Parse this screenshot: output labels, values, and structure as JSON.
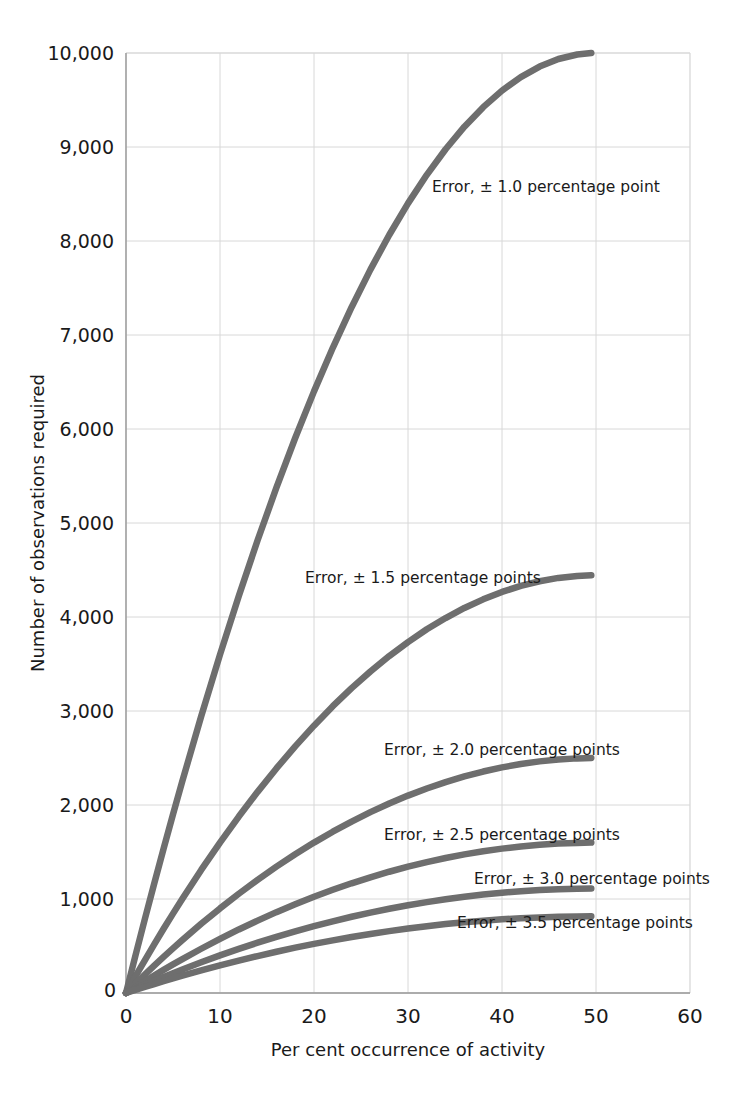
{
  "chart_data": {
    "type": "line",
    "title": "",
    "xlabel": "Per cent occurrence of activity",
    "ylabel": "Number of observations required",
    "xlim": [
      0,
      60
    ],
    "ylim": [
      0,
      10000
    ],
    "xticks": [
      "0",
      "10",
      "20",
      "30",
      "40",
      "50",
      "60"
    ],
    "xtick_values": [
      0,
      10,
      20,
      30,
      40,
      50,
      60
    ],
    "yticks": [
      "0",
      "1,000",
      "2,000",
      "3,000",
      "4,000",
      "5,000",
      "6,000",
      "7,000",
      "8,000",
      "9,000",
      "10,000"
    ],
    "ytick_values": [
      0,
      1000,
      2000,
      3000,
      4000,
      5000,
      6000,
      7000,
      8000,
      9000,
      10000
    ],
    "grid": true,
    "legend_position": "inline-annotations",
    "x": [
      0,
      1,
      2,
      3,
      4,
      5,
      6,
      8,
      10,
      12,
      14,
      16,
      18,
      20,
      22,
      24,
      26,
      28,
      30,
      32,
      34,
      36,
      38,
      40,
      42,
      44,
      46,
      48,
      49.5
    ],
    "series": [
      {
        "name": "Error, ± 1.0 percentage point",
        "error": 1.0,
        "annotation": "Error,  ± 1.0 percentage point",
        "color": "#6e6e6e",
        "values": [
          0,
          396,
          784,
          1164,
          1536,
          1900,
          2256,
          2944,
          3600,
          4224,
          4816,
          5376,
          5904,
          6400,
          6864,
          7296,
          7696,
          8064,
          8400,
          8704,
          8976,
          9216,
          9424,
          9600,
          9744,
          9856,
          9936,
          9984,
          9999
        ]
      },
      {
        "name": "Error, ± 1.5 percentage points",
        "error": 1.5,
        "annotation": "Error,  ± 1.5 percentage points",
        "color": "#6e6e6e",
        "values": [
          0,
          176,
          348,
          517,
          683,
          844,
          1003,
          1309,
          1600,
          1877,
          2140,
          2389,
          2624,
          2844,
          3051,
          3243,
          3420,
          3584,
          3733,
          3869,
          3989,
          4096,
          4188,
          4267,
          4331,
          4380,
          4416,
          4437,
          4444
        ]
      },
      {
        "name": "Error, ± 2.0 percentage points",
        "error": 2.0,
        "annotation": "Error,  ± 2.0 percentage points",
        "color": "#6e6e6e",
        "values": [
          0,
          99,
          196,
          291,
          384,
          475,
          564,
          736,
          900,
          1056,
          1204,
          1344,
          1476,
          1600,
          1716,
          1824,
          1924,
          2016,
          2100,
          2176,
          2244,
          2304,
          2356,
          2400,
          2436,
          2464,
          2484,
          2496,
          2500
        ]
      },
      {
        "name": "Error, ± 2.5 percentage points",
        "error": 2.5,
        "annotation": "Error,  ± 2.5 percentage points",
        "color": "#6e6e6e",
        "values": [
          0,
          63,
          125,
          186,
          246,
          304,
          361,
          471,
          576,
          676,
          770,
          860,
          944,
          1024,
          1098,
          1167,
          1231,
          1290,
          1344,
          1393,
          1436,
          1475,
          1508,
          1536,
          1559,
          1577,
          1590,
          1597,
          1600
        ]
      },
      {
        "name": "Error, ± 3.0 percentage points",
        "error": 3.0,
        "annotation": "Error,  ± 3.0 percentage points",
        "color": "#6e6e6e",
        "values": [
          0,
          44,
          87,
          129,
          171,
          211,
          251,
          327,
          400,
          469,
          535,
          597,
          656,
          711,
          763,
          811,
          855,
          896,
          933,
          967,
          997,
          1024,
          1047,
          1067,
          1083,
          1095,
          1104,
          1109,
          1111
        ]
      },
      {
        "name": "Error, ± 3.5 percentage points",
        "error": 3.5,
        "annotation": "Error,  ± 3.5 percentage points",
        "color": "#6e6e6e",
        "values": [
          0,
          32,
          64,
          95,
          125,
          155,
          184,
          240,
          294,
          345,
          393,
          439,
          482,
          522,
          560,
          596,
          628,
          658,
          686,
          710,
          733,
          753,
          769,
          784,
          796,
          804,
          811,
          815,
          816
        ]
      }
    ],
    "annotations": [
      {
        "text": "Error,  ± 1.0 percentage point",
        "x": 432,
        "y": 192
      },
      {
        "text": "Error,  ± 1.5 percentage points",
        "x": 305,
        "y": 583
      },
      {
        "text": "Error,  ± 2.0 percentage points",
        "x": 384,
        "y": 755
      },
      {
        "text": "Error,  ± 2.5 percentage points",
        "x": 384,
        "y": 840
      },
      {
        "text": "Error,  ± 3.0 percentage points",
        "x": 474,
        "y": 884
      },
      {
        "text": "Error,  ± 3.5 percentage points",
        "x": 457,
        "y": 928
      }
    ],
    "colors": {
      "curve": "#6e6e6e",
      "grid": "#d8d8d8",
      "axis": "#9a9a9a",
      "text": "#1a1a1a",
      "background": "#ffffff"
    }
  },
  "axes": {
    "x_label": "Per cent occurrence of activity",
    "y_label": "Number of observations required",
    "origin_label": "0"
  }
}
